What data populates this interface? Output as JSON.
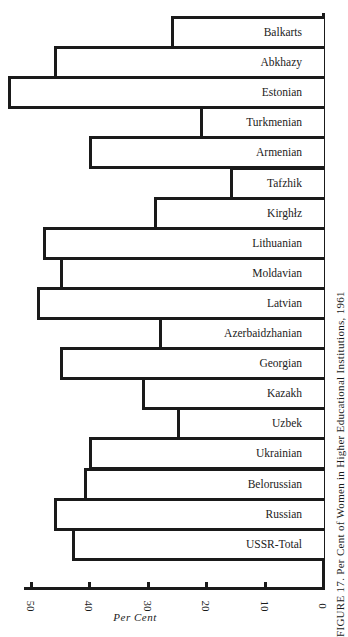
{
  "caption": "FIGURE 17. Per Cent of Women in Higher Educational Institutions, 1961",
  "chart_data": {
    "type": "bar",
    "orientation": "horizontal",
    "title": "FIGURE 17. Per Cent of Women in Higher Educational Institutions, 1961",
    "xlabel": "Per Cent",
    "ylabel": "",
    "xlim": [
      0,
      50
    ],
    "x_direction": "right-to-left",
    "xticks": [
      50,
      40,
      30,
      20,
      10,
      0
    ],
    "grid": false,
    "legend": null,
    "categories": [
      "Balkarts",
      "Abkhazy",
      "Estonian",
      "Turkmenian",
      "Armenian",
      "Tafzhik",
      "Kirghiz",
      "Lithuanian",
      "Moldavian",
      "Latvian",
      "Azerbaidzhanian",
      "Georgian",
      "Kazakh",
      "Uzbek",
      "Ukrainian",
      "Belorussian",
      "Russian",
      "USSR-Total"
    ],
    "values": [
      26,
      46,
      54,
      21,
      40,
      16,
      29,
      48,
      45,
      49,
      28,
      45,
      31,
      25,
      40,
      41,
      46,
      43
    ]
  },
  "labels": [
    "Balkarts",
    "Abkhazy",
    "Estonian",
    "Turkmenian",
    "Armenian",
    "Tafzhik",
    "Kirghłz",
    "Lithuanian",
    "Moldavian",
    "Latvian",
    "Azerbaidzhanian",
    "Georgian",
    "Kazakh",
    "Uzbek",
    "Ukrainian",
    "Belorussian",
    "Russian",
    "USSR-Total"
  ],
  "ticks": [
    "50",
    "40",
    "30",
    "20",
    "10",
    "0"
  ],
  "colors": {
    "ink": "#1a1a1a",
    "paper": "#ffffff"
  }
}
